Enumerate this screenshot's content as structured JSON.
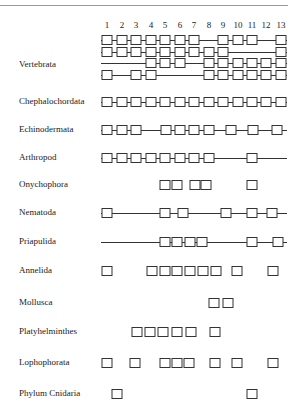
{
  "columns": [
    "1",
    "2",
    "3",
    "4",
    "5",
    "6",
    "7",
    "8",
    "9",
    "10",
    "11",
    "12",
    "13"
  ],
  "column_x": [
    107,
    122,
    136,
    151,
    165,
    180,
    194,
    209,
    223,
    238,
    252,
    266,
    281
  ],
  "line_start": 101,
  "line_end": 287,
  "rows": [
    {
      "label": "Vertebrata",
      "label_y": 64,
      "tracks": [
        {
          "y": 40,
          "line": [
            101,
            287
          ],
          "boxes": [
            107,
            122,
            136,
            151,
            165,
            180,
            194,
            223,
            238,
            252,
            281
          ]
        },
        {
          "y": 52,
          "line": [
            101,
            287
          ],
          "boxes": [
            107,
            122,
            136,
            151,
            165,
            180,
            194,
            209,
            223,
            281
          ]
        },
        {
          "y": 63,
          "line": [
            101,
            287
          ],
          "boxes": [
            151,
            165,
            180,
            209,
            223,
            238,
            252,
            266,
            281
          ]
        },
        {
          "y": 75,
          "line": [
            101,
            287
          ],
          "boxes": [
            107,
            136,
            151,
            209,
            223,
            238,
            252,
            266,
            281
          ]
        }
      ]
    },
    {
      "label": "Chephalochordata",
      "label_y": 101,
      "tracks": [
        {
          "y": 102,
          "line": [
            101,
            287
          ],
          "boxes": [
            107,
            122,
            136,
            151,
            165,
            180,
            194,
            209,
            223,
            238,
            252,
            266,
            281
          ]
        }
      ]
    },
    {
      "label": "Echinodermata",
      "label_y": 129,
      "tracks": [
        {
          "y": 130,
          "line": [
            101,
            287
          ],
          "boxes": [
            107,
            122,
            136,
            166,
            180,
            194,
            209,
            231,
            253,
            277
          ]
        }
      ]
    },
    {
      "label": "Arthropod",
      "label_y": 157,
      "tracks": [
        {
          "y": 158,
          "line": [
            101,
            287
          ],
          "boxes": [
            107,
            122,
            136,
            151,
            165,
            180,
            194,
            209,
            252
          ]
        }
      ]
    },
    {
      "label": "Onychophora",
      "label_y": 184,
      "tracks": [
        {
          "y": 185,
          "line": null,
          "boxes": [
            165,
            177,
            195,
            206,
            252
          ]
        }
      ]
    },
    {
      "label": "Nematoda",
      "label_y": 212,
      "tracks": [
        {
          "y": 213,
          "line": [
            101,
            287
          ],
          "boxes": [
            107,
            165,
            183,
            226,
            252,
            272
          ]
        }
      ]
    },
    {
      "label": "Priapulida",
      "label_y": 241,
      "tracks": [
        {
          "y": 242,
          "line": [
            101,
            287
          ],
          "boxes": [
            165,
            177,
            190,
            202,
            252,
            278
          ]
        }
      ]
    },
    {
      "label": "Annelida",
      "label_y": 270,
      "tracks": [
        {
          "y": 271,
          "line": null,
          "boxes": [
            107,
            152,
            165,
            177,
            190,
            203,
            216,
            237,
            273
          ]
        }
      ]
    },
    {
      "label": "Mollusca",
      "label_y": 302,
      "tracks": [
        {
          "y": 303,
          "line": null,
          "boxes": [
            214,
            228
          ]
        }
      ]
    },
    {
      "label": "Platyhelminthes",
      "label_y": 331,
      "tracks": [
        {
          "y": 332,
          "line": null,
          "boxes": [
            137,
            150,
            163,
            177,
            191,
            215
          ]
        }
      ]
    },
    {
      "label": "Lophophorata",
      "label_y": 362,
      "tracks": [
        {
          "y": 363,
          "line": null,
          "boxes": [
            107,
            135,
            165,
            177,
            189,
            215,
            237,
            273
          ]
        }
      ]
    },
    {
      "label": "Phylum Cnidaria",
      "label_y": 393,
      "tracks": [
        {
          "y": 394,
          "line": null,
          "boxes": [
            117,
            252
          ]
        }
      ]
    }
  ]
}
